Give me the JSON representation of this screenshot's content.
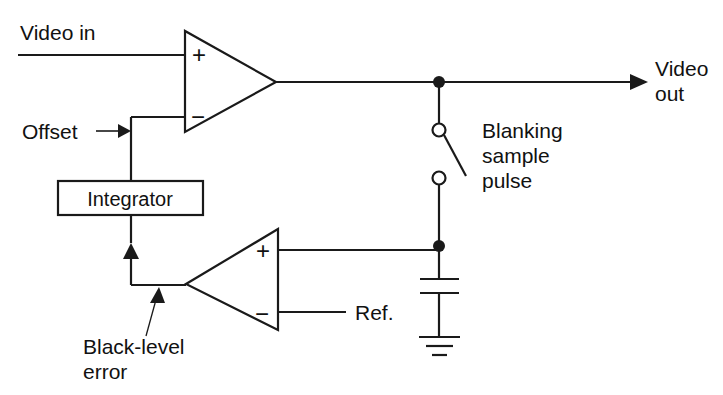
{
  "diagram": {
    "background_color": "#ffffff",
    "line_color": "#1a1a1a",
    "labels": {
      "video_in": "Video in",
      "video_out_line1": "Video",
      "video_out_line2": "out",
      "offset": "Offset",
      "integrator": "Integrator",
      "blanking_line1": "Blanking",
      "blanking_line2": "sample",
      "blanking_line3": "pulse",
      "ref": "Ref.",
      "black_level_line1": "Black-level",
      "black_level_line2": "error"
    },
    "opamp_top": {
      "name": "video amplifier",
      "plus": "+",
      "minus": "−"
    },
    "opamp_bottom": {
      "name": "black-level comparator",
      "plus": "+",
      "minus": "−"
    },
    "components": [
      {
        "id": "opamp-top",
        "type": "op-amp",
        "orientation": "right"
      },
      {
        "id": "integrator-block",
        "type": "block",
        "label": "Integrator"
      },
      {
        "id": "opamp-bottom",
        "type": "op-amp",
        "orientation": "left"
      },
      {
        "id": "sample-switch",
        "type": "switch",
        "state": "open"
      },
      {
        "id": "hold-capacitor",
        "type": "capacitor"
      },
      {
        "id": "ground",
        "type": "ground"
      }
    ]
  }
}
